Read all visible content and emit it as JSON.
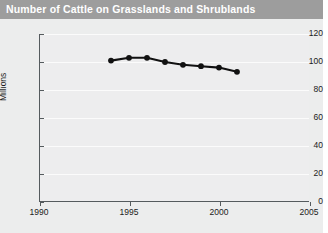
{
  "title": "Number of Cattle on Grasslands and Shrublands",
  "colors": {
    "title_bar": "#9d9d9d",
    "title_text": "#ffffff",
    "figure_bg": "#eceded",
    "plot_bg": "#ededee",
    "axis": "#555b5e",
    "grid": "#fbfbfb",
    "series": "#111111"
  },
  "chart_data": {
    "type": "line",
    "title": "Number of Cattle on Grasslands and Shrublands",
    "xlabel": "",
    "ylabel": "Millions",
    "xlim": [
      1990,
      2005
    ],
    "ylim": [
      0,
      120
    ],
    "xticks": [
      1990,
      1995,
      2000,
      2005
    ],
    "yticks": [
      0,
      20,
      40,
      60,
      80,
      100,
      120
    ],
    "xtick_labels": [
      "1990",
      "1995",
      "2000",
      "2005"
    ],
    "ytick_labels": [
      "0",
      "20",
      "40",
      "60",
      "80",
      "100",
      "120"
    ],
    "grid": "horizontal",
    "legend": "none",
    "marker": "circle",
    "series": [
      {
        "name": "Cattle on grasslands and shrublands",
        "x": [
          1994,
          1995,
          1996,
          1997,
          1998,
          1999,
          2000,
          2001
        ],
        "values": [
          101,
          103,
          103,
          100,
          98,
          97,
          96,
          93
        ]
      }
    ]
  }
}
